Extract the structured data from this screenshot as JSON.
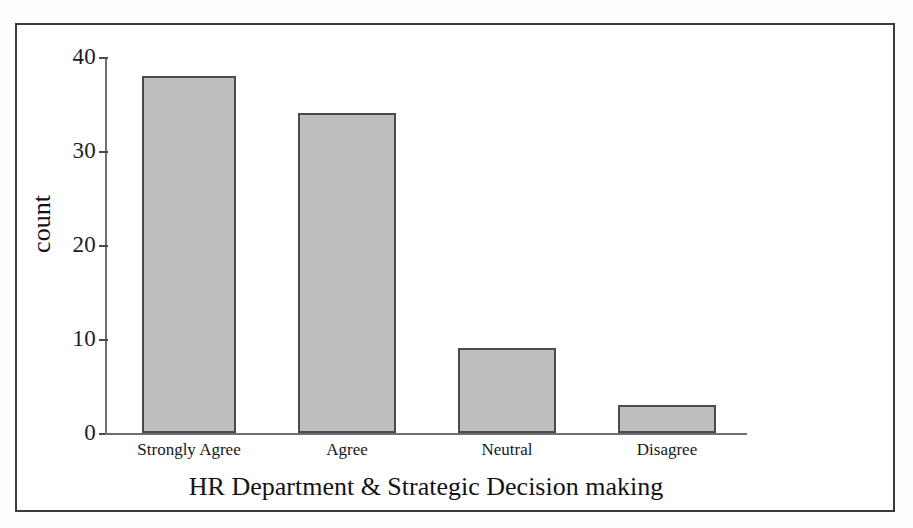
{
  "chart_data": {
    "type": "bar",
    "title": "",
    "xlabel": "HR Department & Strategic Decision making",
    "ylabel": "count",
    "categories": [
      "Strongly Agree",
      "Agree",
      "Neutral",
      "Disagree"
    ],
    "values": [
      38,
      34,
      9,
      3
    ],
    "ylim": [
      0,
      40
    ],
    "yticks": [
      0,
      10,
      20,
      30,
      40
    ],
    "ytick_labels": [
      "0",
      "10",
      "20",
      "30",
      "40"
    ],
    "grid": false,
    "legend": null,
    "bar_fill_color": "#bebebe",
    "bar_edge_color": "#4b4b4f",
    "axis_color": "#6e6e72",
    "frame_color": "#3b3b3f",
    "background_color": "#ffffff"
  },
  "axes": {
    "y_title": "count",
    "x_title": "HR Department & Strategic Decision making",
    "y_tick_labels": [
      "40",
      "30",
      "20",
      "10",
      "0"
    ],
    "x_tick_labels": [
      "Strongly Agree",
      "Agree",
      "Neutral",
      "Disagree"
    ]
  },
  "bars": [
    {
      "label": "Strongly Agree",
      "value": 38
    },
    {
      "label": "Agree",
      "value": 34
    },
    {
      "label": "Neutral",
      "value": 9
    },
    {
      "label": "Disagree",
      "value": 3
    }
  ]
}
